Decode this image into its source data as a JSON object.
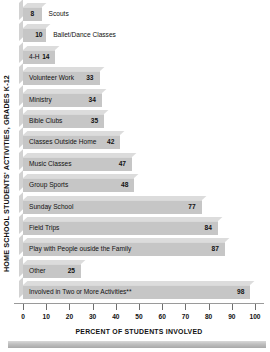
{
  "chart_data": {
    "type": "bar",
    "orientation": "horizontal",
    "title": "",
    "ylabel": "HOME SCHOOL STUDENTS' ACTIVITIES, GRADES K-12",
    "xlabel": "PERCENT OF STUDENTS INVOLVED",
    "xlim": [
      0,
      100
    ],
    "xticks": [
      0,
      10,
      20,
      30,
      40,
      50,
      60,
      70,
      80,
      90,
      100
    ],
    "xtick_labels": [
      "0",
      "10",
      "20",
      "30",
      "40",
      "50",
      "60",
      "70",
      "80",
      "90",
      "100"
    ],
    "grid": false,
    "legend": null,
    "bar_color": "#c6c6c6",
    "bar_top_color": "#dcdcdc",
    "categories": [
      "Scouts",
      "Ballet/Dance Classes",
      "4-H",
      "Volunteer Work",
      "Ministry",
      "Bible Clubs",
      "Classes Outside Home",
      "Music Classes",
      "Group Sports",
      "Sunday School",
      "Field Trips",
      "Play with People ouside the Family",
      "Other",
      "Involved in Two or More Activities**"
    ],
    "values": [
      8,
      10,
      14,
      33,
      34,
      35,
      42,
      47,
      48,
      77,
      84,
      87,
      25,
      98
    ],
    "bars": [
      {
        "label": "Scouts",
        "value": 8,
        "value_text": "8",
        "label_placement": "outside",
        "value_placement": "inside"
      },
      {
        "label": "Ballet/Dance Classes",
        "value": 10,
        "value_text": "10",
        "label_placement": "outside",
        "value_placement": "inside"
      },
      {
        "label": "4-H",
        "value": 14,
        "value_text": "14",
        "label_placement": "inside",
        "value_placement": "inside"
      },
      {
        "label": "Volunteer Work",
        "value": 33,
        "value_text": "33",
        "label_placement": "inside",
        "value_placement": "inside"
      },
      {
        "label": "Ministry",
        "value": 34,
        "value_text": "34",
        "label_placement": "inside",
        "value_placement": "inside"
      },
      {
        "label": "Bible Clubs",
        "value": 35,
        "value_text": "35",
        "label_placement": "inside",
        "value_placement": "inside"
      },
      {
        "label": "Classes Outside Home",
        "value": 42,
        "value_text": "42",
        "label_placement": "inside",
        "value_placement": "inside"
      },
      {
        "label": "Music Classes",
        "value": 47,
        "value_text": "47",
        "label_placement": "inside",
        "value_placement": "inside"
      },
      {
        "label": "Group Sports",
        "value": 48,
        "value_text": "48",
        "label_placement": "inside",
        "value_placement": "inside"
      },
      {
        "label": "Sunday School",
        "value": 77,
        "value_text": "77",
        "label_placement": "inside",
        "value_placement": "inside"
      },
      {
        "label": "Field Trips",
        "value": 84,
        "value_text": "84",
        "label_placement": "inside",
        "value_placement": "inside"
      },
      {
        "label": "Play with People ouside the Family",
        "value": 87,
        "value_text": "87",
        "label_placement": "inside",
        "value_placement": "inside"
      },
      {
        "label": "Other",
        "value": 25,
        "value_text": "25",
        "label_placement": "inside",
        "value_placement": "inside"
      },
      {
        "label": "Involved in Two or More Activities**",
        "value": 98,
        "value_text": "98",
        "label_placement": "inside",
        "value_placement": "inside"
      }
    ]
  }
}
